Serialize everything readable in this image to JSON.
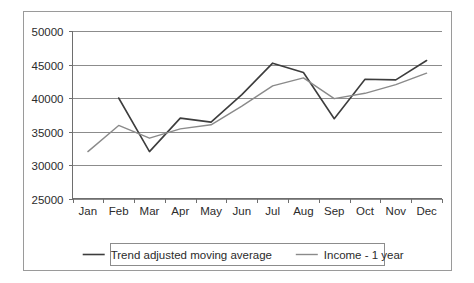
{
  "chart_data": {
    "type": "line",
    "title": "",
    "subtitle": "",
    "xlabel": "",
    "ylabel": "",
    "categories": [
      "Jan",
      "Feb",
      "Mar",
      "Apr",
      "May",
      "Jun",
      "Jul",
      "Aug",
      "Sep",
      "Oct",
      "Nov",
      "Dec"
    ],
    "ylim": [
      25000,
      50000
    ],
    "ytick_labels": [
      "50000",
      "45000",
      "40000",
      "35000",
      "30000",
      "25000"
    ],
    "ytick_values": [
      50000,
      45000,
      40000,
      35000,
      30000,
      25000
    ],
    "grid": true,
    "legend_position": "bottom",
    "series": [
      {
        "name": "Trend adjusted moving average",
        "color": "#3d3d3d",
        "width": 1.6,
        "values": [
          null,
          40000,
          32000,
          37000,
          36400,
          40500,
          45200,
          43800,
          36900,
          42800,
          42700,
          45600
        ]
      },
      {
        "name": "Income - 1 year",
        "color": "#8a8a8a",
        "width": 1.4,
        "values": [
          32000,
          35900,
          34000,
          35400,
          36000,
          38800,
          41800,
          43000,
          39900,
          40700,
          42000,
          43700
        ]
      }
    ]
  },
  "legend": {
    "entries": [
      {
        "label": "Trend adjusted moving average"
      },
      {
        "label": "Income - 1 year"
      }
    ]
  },
  "colors": {
    "series_dark": "#3d3d3d",
    "series_light": "#8a8a8a",
    "grid": "#8c8c8c",
    "frame": "#9a9a9a",
    "text": "#2b2b2b",
    "background": "#ffffff"
  }
}
